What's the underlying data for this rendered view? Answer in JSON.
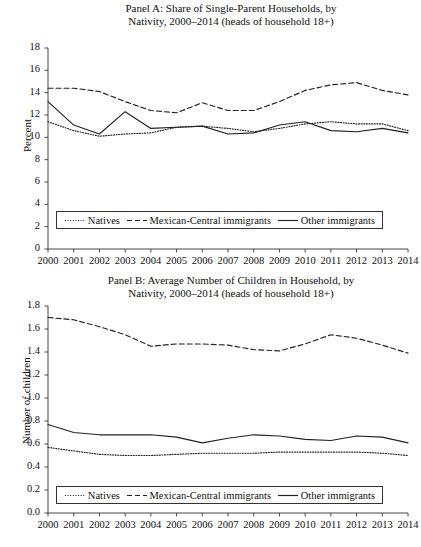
{
  "figure": {
    "series_names": {
      "natives": "Natives",
      "mexican_central": "Mexican-Central immigrants",
      "other": "Other immigrants"
    },
    "legend_items": [
      {
        "label": "Natives",
        "style": "dotted",
        "name": "legend-natives"
      },
      {
        "label": "Mexican-Central immigrants",
        "style": "dashed",
        "name": "legend-mexican-central"
      },
      {
        "label": "Other immigrants",
        "style": "solid",
        "name": "legend-other"
      }
    ]
  },
  "chart_data": [
    {
      "id": "panel-a",
      "type": "line",
      "title": "Panel A: Share of Single-Parent Households, by Nativity, 2000–2014 (heads of household 18+)",
      "title_line1": "Panel A: Share of Single-Parent Households, by",
      "title_line2": "Nativity, 2000–2014 (heads of household 18+)",
      "xlabel": "",
      "ylabel": "Percent",
      "ylim": [
        0,
        18
      ],
      "yticks": [
        0,
        2,
        4,
        6,
        8,
        10,
        12,
        14,
        16,
        18
      ],
      "ytick_labels": [
        "0",
        "2",
        "4",
        "6",
        "8",
        "10",
        "12",
        "14",
        "16",
        "18"
      ],
      "categories": [
        2000,
        2001,
        2002,
        2003,
        2004,
        2005,
        2006,
        2007,
        2008,
        2009,
        2010,
        2011,
        2012,
        2013,
        2014
      ],
      "xtick_labels": [
        "2000",
        "2001",
        "2002",
        "2003",
        "2004",
        "2005",
        "2006",
        "2007",
        "2008",
        "2009",
        "2010",
        "2011",
        "2012",
        "2013",
        "2014"
      ],
      "grid": false,
      "legend_position": "bottom-inside",
      "series": [
        {
          "name": "Natives",
          "style": "dotted",
          "values": [
            11.4,
            10.6,
            10.1,
            10.3,
            10.4,
            10.9,
            11.0,
            10.8,
            10.5,
            10.8,
            11.2,
            11.4,
            11.2,
            11.2,
            10.6
          ]
        },
        {
          "name": "Mexican-Central immigrants",
          "style": "dashed",
          "values": [
            14.4,
            14.4,
            14.1,
            13.2,
            12.4,
            12.2,
            13.1,
            12.4,
            12.4,
            13.2,
            14.2,
            14.7,
            14.9,
            14.2,
            13.8
          ]
        },
        {
          "name": "Other immigrants",
          "style": "solid",
          "values": [
            13.2,
            11.1,
            10.3,
            12.3,
            10.8,
            10.9,
            11.0,
            10.3,
            10.4,
            11.1,
            11.4,
            10.6,
            10.5,
            10.8,
            10.4
          ]
        }
      ]
    },
    {
      "id": "panel-b",
      "type": "line",
      "title": "Panel B: Average Number of Children in Household, by Nativity, 2000–2014 (heads of household 18+)",
      "title_line1": "Panel B: Average Number of Children in Household, by",
      "title_line2": "Nativity, 2000–2014 (heads of household 18+)",
      "xlabel": "",
      "ylabel": "Number of children",
      "ylim": [
        0.0,
        1.8
      ],
      "yticks": [
        0.0,
        0.2,
        0.4,
        0.6,
        0.8,
        1.0,
        1.2,
        1.4,
        1.6,
        1.8
      ],
      "ytick_labels": [
        "0.0",
        "0.2",
        "0.4",
        "0.6",
        "0.8",
        "1.0",
        "1.2",
        "1.4",
        "1.6",
        "1.8"
      ],
      "categories": [
        2000,
        2001,
        2002,
        2003,
        2004,
        2005,
        2006,
        2007,
        2008,
        2009,
        2010,
        2011,
        2012,
        2013,
        2014
      ],
      "xtick_labels": [
        "2000",
        "2001",
        "2002",
        "2003",
        "2004",
        "2005",
        "2006",
        "2007",
        "2008",
        "2009",
        "2010",
        "2011",
        "2012",
        "2013",
        "2014"
      ],
      "grid": false,
      "legend_position": "bottom-inside",
      "series": [
        {
          "name": "Natives",
          "style": "dotted",
          "values": [
            0.57,
            0.54,
            0.51,
            0.5,
            0.5,
            0.51,
            0.52,
            0.52,
            0.52,
            0.53,
            0.53,
            0.53,
            0.53,
            0.52,
            0.5
          ]
        },
        {
          "name": "Mexican-Central immigrants",
          "style": "dashed",
          "values": [
            1.7,
            1.68,
            1.62,
            1.55,
            1.45,
            1.47,
            1.47,
            1.46,
            1.42,
            1.41,
            1.47,
            1.55,
            1.52,
            1.46,
            1.39
          ]
        },
        {
          "name": "Other immigrants",
          "style": "solid",
          "values": [
            0.77,
            0.7,
            0.68,
            0.68,
            0.68,
            0.66,
            0.61,
            0.65,
            0.68,
            0.67,
            0.64,
            0.63,
            0.67,
            0.66,
            0.61
          ]
        }
      ]
    }
  ]
}
